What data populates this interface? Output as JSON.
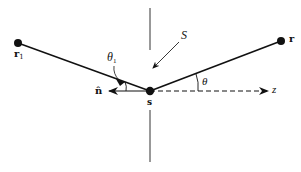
{
  "diagram": {
    "colors": {
      "stroke": "#111111",
      "background": "#ffffff"
    },
    "points": {
      "r1": {
        "label": "r",
        "subscript": "1"
      },
      "s": {
        "label": "s"
      },
      "r": {
        "label": "r"
      }
    },
    "vectors": {
      "normal": {
        "label": "n̂"
      },
      "axis": {
        "label": "z"
      }
    },
    "angles": {
      "theta1": {
        "label": "θ",
        "subscript": "1"
      },
      "theta": {
        "label": "θ"
      }
    },
    "surface": {
      "label": "S"
    }
  }
}
